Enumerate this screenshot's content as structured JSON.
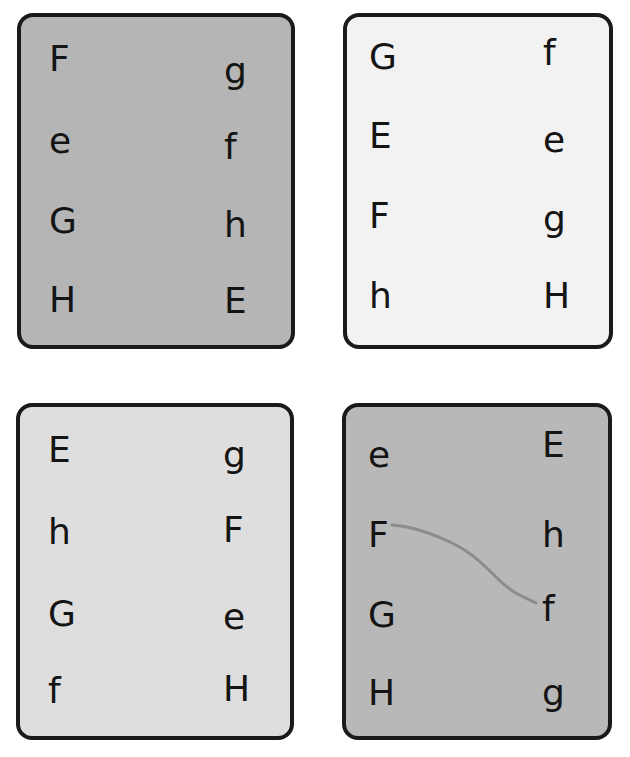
{
  "page": {
    "background_color": "#ffffff",
    "width": 630,
    "height": 757,
    "layout": "2x2-grid-of-cards",
    "card_border_color": "#1a1a1a",
    "letter_color": "#141414"
  },
  "cards": [
    {
      "id": "card-1",
      "position": "top-left",
      "background_color": "#b5b5b5",
      "left_column": [
        {
          "label": "F",
          "case": "uppercase"
        },
        {
          "label": "e",
          "case": "lowercase"
        },
        {
          "label": "G",
          "case": "uppercase"
        },
        {
          "label": "H",
          "case": "uppercase"
        }
      ],
      "right_column": [
        {
          "label": "g",
          "case": "lowercase"
        },
        {
          "label": "f",
          "case": "lowercase"
        },
        {
          "label": "h",
          "case": "lowercase"
        },
        {
          "label": "E",
          "case": "uppercase"
        }
      ],
      "connection_line": null
    },
    {
      "id": "card-2",
      "position": "top-right",
      "background_color": "#f2f2f2",
      "left_column": [
        {
          "label": "G",
          "case": "uppercase"
        },
        {
          "label": "E",
          "case": "uppercase"
        },
        {
          "label": "F",
          "case": "uppercase"
        },
        {
          "label": "h",
          "case": "lowercase"
        }
      ],
      "right_column": [
        {
          "label": "f",
          "case": "lowercase"
        },
        {
          "label": "e",
          "case": "lowercase"
        },
        {
          "label": "g",
          "case": "lowercase"
        },
        {
          "label": "H",
          "case": "uppercase"
        }
      ],
      "connection_line": null
    },
    {
      "id": "card-3",
      "position": "bottom-left",
      "background_color": "#dedede",
      "left_column": [
        {
          "label": "E",
          "case": "uppercase"
        },
        {
          "label": "h",
          "case": "lowercase"
        },
        {
          "label": "G",
          "case": "uppercase"
        },
        {
          "label": "f",
          "case": "lowercase"
        }
      ],
      "right_column": [
        {
          "label": "g",
          "case": "lowercase"
        },
        {
          "label": "F",
          "case": "uppercase"
        },
        {
          "label": "e",
          "case": "lowercase"
        },
        {
          "label": "H",
          "case": "uppercase"
        }
      ],
      "connection_line": null
    },
    {
      "id": "card-4",
      "position": "bottom-right",
      "background_color": "#b8b8b8",
      "left_column": [
        {
          "label": "e",
          "case": "lowercase"
        },
        {
          "label": "F",
          "case": "uppercase"
        },
        {
          "label": "G",
          "case": "uppercase"
        },
        {
          "label": "H",
          "case": "uppercase"
        }
      ],
      "right_column": [
        {
          "label": "E",
          "case": "uppercase"
        },
        {
          "label": "h",
          "case": "lowercase"
        },
        {
          "label": "f",
          "case": "lowercase"
        },
        {
          "label": "g",
          "case": "lowercase"
        }
      ],
      "connection_line": {
        "from_label": "F",
        "to_label": "f",
        "color": "#8c8c8c",
        "stroke_width": 3,
        "style": "hand-drawn-curve",
        "path": "M 46 118 C 70 120, 90 128, 108 137 C 126 146, 138 158, 152 172 C 166 186, 178 190, 190 196"
      }
    }
  ]
}
